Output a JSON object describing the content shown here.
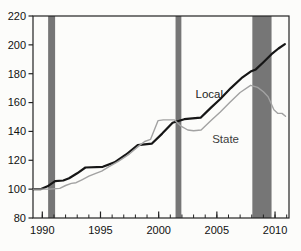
{
  "figure": {
    "background": "#fcfcfa"
  },
  "chart_data": {
    "type": "line",
    "title": "",
    "xlabel": "",
    "ylabel": "",
    "xlim": [
      1989.2,
      2011.2
    ],
    "ylim": [
      80,
      220
    ],
    "y_ticks": [
      80,
      100,
      120,
      140,
      160,
      180,
      200,
      220
    ],
    "x_major_ticks": [
      1990,
      1995,
      2000,
      2005,
      2010
    ],
    "x_minor_ticks": [
      1990,
      1991,
      1992,
      1993,
      1994,
      1995,
      1996,
      1997,
      1998,
      1999,
      2000,
      2001,
      2002,
      2003,
      2004,
      2005,
      2006,
      2007,
      2008,
      2009,
      2010,
      2011
    ],
    "grid": false,
    "legend_position": "inline-labels",
    "colors": {
      "axis": "#222222",
      "tick_label": "#111111",
      "recession_band": "#767676",
      "local_line": "#161616",
      "state_line": "#a2a2a2",
      "local_label": "#1c1c1c",
      "state_label": "#3d3d3d"
    },
    "recession_bands": [
      {
        "start": 1990.5,
        "end": 1991.1
      },
      {
        "start": 2001.45,
        "end": 2001.95
      },
      {
        "start": 2008.05,
        "end": 2009.7
      }
    ],
    "series": [
      {
        "name": "Local",
        "color_key": "local_line",
        "stroke_width": 2.2,
        "points": [
          [
            1989.2,
            100
          ],
          [
            1989.9,
            100
          ],
          [
            1990.45,
            102
          ],
          [
            1991.1,
            105.5
          ],
          [
            1991.8,
            106
          ],
          [
            1992.3,
            107.5
          ],
          [
            1993.0,
            111
          ],
          [
            1993.7,
            115
          ],
          [
            1995.2,
            115.5
          ],
          [
            1996.2,
            118.5
          ],
          [
            1997.2,
            124
          ],
          [
            1998.2,
            130.5
          ],
          [
            1999.4,
            131.5
          ],
          [
            2000.3,
            138.5
          ],
          [
            2001.2,
            146
          ],
          [
            2002.2,
            148.5
          ],
          [
            2003.6,
            149.5
          ],
          [
            2004.5,
            156.5
          ],
          [
            2005.3,
            162.5
          ],
          [
            2006.2,
            170
          ],
          [
            2007.2,
            177.5
          ],
          [
            2007.9,
            181.5
          ],
          [
            2008.35,
            183
          ],
          [
            2009.0,
            188
          ],
          [
            2009.7,
            193.5
          ],
          [
            2010.3,
            197.5
          ],
          [
            2010.85,
            200.5
          ]
        ]
      },
      {
        "name": "State",
        "color_key": "state_line",
        "stroke_width": 1.4,
        "points": [
          [
            1989.2,
            100
          ],
          [
            1990.6,
            100
          ],
          [
            1991.5,
            100.5
          ],
          [
            1992.0,
            102.5
          ],
          [
            1992.5,
            104
          ],
          [
            1992.9,
            104.5
          ],
          [
            1993.4,
            106.5
          ],
          [
            1994.0,
            109
          ],
          [
            1994.6,
            111
          ],
          [
            1995.1,
            112.5
          ],
          [
            1995.7,
            115.5
          ],
          [
            1996.5,
            119
          ],
          [
            1997.5,
            124.5
          ],
          [
            1998.3,
            130
          ],
          [
            1998.8,
            133
          ],
          [
            1999.3,
            134.5
          ],
          [
            1999.95,
            147.5
          ],
          [
            2000.4,
            148
          ],
          [
            2001.35,
            148
          ],
          [
            2001.95,
            143.5
          ],
          [
            2002.5,
            141
          ],
          [
            2003.0,
            140.5
          ],
          [
            2003.65,
            141
          ],
          [
            2004.5,
            147.5
          ],
          [
            2005.3,
            153.5
          ],
          [
            2006.1,
            160
          ],
          [
            2007.0,
            167
          ],
          [
            2007.9,
            172
          ],
          [
            2008.5,
            170.5
          ],
          [
            2009.0,
            167.5
          ],
          [
            2009.4,
            164
          ],
          [
            2009.9,
            155
          ],
          [
            2010.25,
            152.5
          ],
          [
            2010.6,
            152.5
          ],
          [
            2010.9,
            150.5
          ]
        ]
      }
    ],
    "annotations": [
      {
        "text": "Local",
        "year": 2004.35,
        "value": 166,
        "color_key": "local_label",
        "font_size": 11.5
      },
      {
        "text": "State",
        "year": 2005.75,
        "value": 135,
        "color_key": "state_label",
        "font_size": 11.5
      }
    ]
  }
}
